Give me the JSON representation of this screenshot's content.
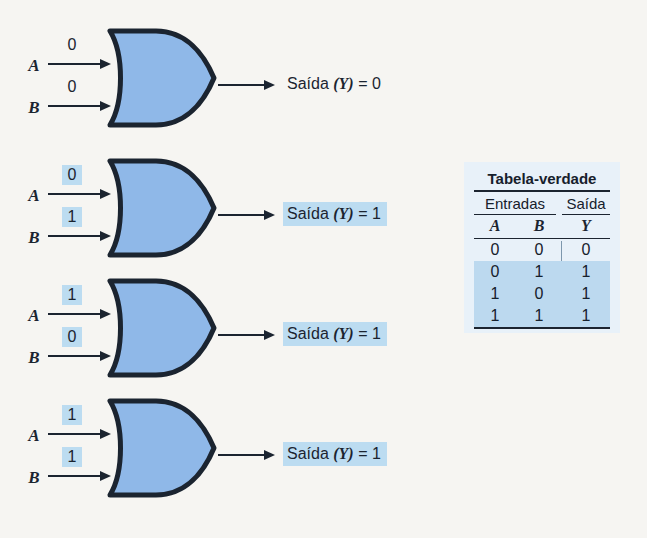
{
  "colors": {
    "background": "#f6f5f2",
    "gate_fill": "#8fb8e8",
    "gate_outline": "#1b2430",
    "highlight": "#bcdcf1",
    "table_panel": "#e8f1f9",
    "table_row_highlight": "#bcd9ef"
  },
  "gate_rows": [
    {
      "input_a_label": "A",
      "input_b_label": "B",
      "input_a_value": "0",
      "input_b_value": "0",
      "inputs_highlighted": false,
      "output_prefix": "Saída",
      "output_var": "(Y)",
      "output_equals": "=",
      "output_value": "0",
      "output_highlighted": false
    },
    {
      "input_a_label": "A",
      "input_b_label": "B",
      "input_a_value": "0",
      "input_b_value": "1",
      "inputs_highlighted": true,
      "output_prefix": "Saída",
      "output_var": "(Y)",
      "output_equals": "=",
      "output_value": "1",
      "output_highlighted": true
    },
    {
      "input_a_label": "A",
      "input_b_label": "B",
      "input_a_value": "1",
      "input_b_value": "0",
      "inputs_highlighted": true,
      "output_prefix": "Saída",
      "output_var": "(Y)",
      "output_equals": "=",
      "output_value": "1",
      "output_highlighted": true
    },
    {
      "input_a_label": "A",
      "input_b_label": "B",
      "input_a_value": "1",
      "input_b_value": "1",
      "inputs_highlighted": true,
      "output_prefix": "Saída",
      "output_var": "(Y)",
      "output_equals": "=",
      "output_value": "1",
      "output_highlighted": true
    }
  ],
  "truth_table": {
    "title": "Tabela-verdade",
    "group_headers": {
      "inputs": "Entradas",
      "output": "Saída"
    },
    "columns": [
      "A",
      "B",
      "Y"
    ],
    "rows": [
      {
        "cells": [
          "0",
          "0",
          "0"
        ],
        "highlighted": false
      },
      {
        "cells": [
          "0",
          "1",
          "1"
        ],
        "highlighted": true
      },
      {
        "cells": [
          "1",
          "0",
          "1"
        ],
        "highlighted": true
      },
      {
        "cells": [
          "1",
          "1",
          "1"
        ],
        "highlighted": true
      }
    ]
  }
}
